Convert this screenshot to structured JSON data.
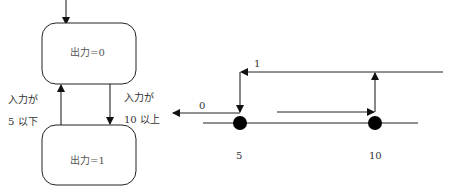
{
  "state_diagram": {
    "states": [
      {
        "id": "s0",
        "label": "出力=0"
      },
      {
        "id": "s1",
        "label": "出力=1"
      }
    ],
    "transitions": [
      {
        "from": "s1",
        "to": "s0",
        "label_line1": "入力が",
        "label_line2": "5 以下"
      },
      {
        "from": "s0",
        "to": "s1",
        "label_line1": "入力が",
        "label_line2": "10 以上"
      }
    ],
    "initial_state": "s0"
  },
  "hysteresis": {
    "output_high_label": "1",
    "output_low_label": "0",
    "thresholds": [
      {
        "value_label": "5"
      },
      {
        "value_label": "10"
      }
    ]
  },
  "colors": {
    "stroke": "#1a1a1a",
    "text": "#333333"
  }
}
